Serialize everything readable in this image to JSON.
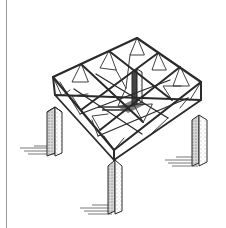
{
  "illustration": {
    "subject": "space-frame-roof-on-four-pillars",
    "style": "isometric-ink-sketch",
    "colors": {
      "background": "#ffffff",
      "ink": "#2a2a2a",
      "shadow": "#555555",
      "edge_line": "#9a9a9a"
    }
  }
}
